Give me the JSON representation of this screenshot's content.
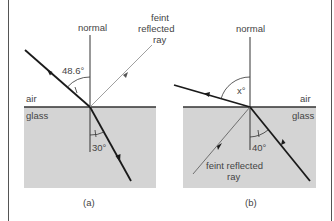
{
  "figure": {
    "panels": [
      {
        "id": "a",
        "caption": "(a)",
        "normal_label": "normal",
        "medium_top": "air",
        "medium_bottom": "glass",
        "angle_incident": "48.6°",
        "angle_refracted": "30°",
        "reflected_label_lines": [
          "feint",
          "reflected",
          "ray"
        ]
      },
      {
        "id": "b",
        "caption": "(b)",
        "normal_label": "normal",
        "medium_top": "air",
        "medium_bottom": "glass",
        "angle_refracted": "x°",
        "angle_incident": "40°",
        "reflected_label_lines": [
          "feint reflected",
          "ray"
        ]
      }
    ],
    "colors": {
      "glass": "#d4d4d4",
      "ray": "#1a1a1a",
      "faint_ray": "#888888",
      "text": "#444444"
    }
  }
}
